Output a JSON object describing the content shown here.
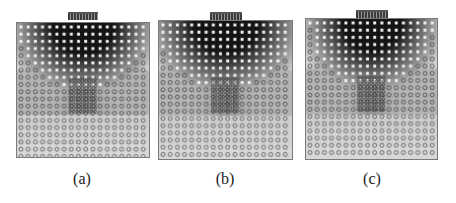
{
  "figure": {
    "panels": [
      {
        "id": "a",
        "label": "(a)",
        "box": [
          16,
          22,
          134,
          136
        ],
        "electrode": [
          68,
          12,
          30
        ],
        "caption_x": 62
      },
      {
        "id": "b",
        "label": "(b)",
        "box": [
          158,
          20,
          135,
          140
        ],
        "electrode": [
          210,
          12,
          32
        ],
        "caption_x": 205
      },
      {
        "id": "c",
        "label": "(c)",
        "box": [
          305,
          18,
          133,
          142
        ],
        "electrode": [
          356,
          10,
          32
        ],
        "caption_x": 352
      }
    ],
    "caption_y": 170,
    "colors": {
      "dark_field": "#1a1a1a",
      "mid_field": "#8c8c8c",
      "light_field": "#dcdcdc",
      "background": "#ffffff",
      "dot_light": "#f2f2f2",
      "dot_dark": "#3c3c3c"
    }
  }
}
